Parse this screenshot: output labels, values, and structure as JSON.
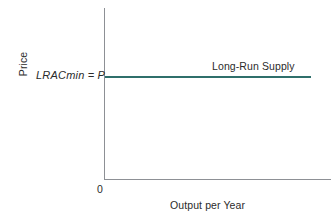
{
  "chart_data": {
    "type": "line",
    "title": "",
    "subtitle": "",
    "xlabel": "Output per Year",
    "ylabel": "Price",
    "origin_label": "0",
    "y_value_label": "LRACmin = P",
    "annotations": [
      {
        "text": "Long-Run Supply",
        "position": "above-right-of-line"
      }
    ],
    "series": [
      {
        "name": "Long-Run Supply",
        "color": "#2f6f6b",
        "shape": "horizontal",
        "y_value": "LRACmin = P",
        "x": [
          0,
          100
        ],
        "values": [
          60,
          60
        ]
      }
    ],
    "xlim": [
      0,
      110
    ],
    "ylim": [
      0,
      100
    ],
    "grid": false,
    "legend": "inline-annotation",
    "axis_color": "#8d9095",
    "background": "#ffffff"
  },
  "axes": {
    "y_label": "Price",
    "x_label": "Output per Year",
    "origin": "0",
    "price_level_label": "LRACmin = P"
  },
  "curve": {
    "label": "Long-Run Supply",
    "color": "#2f6f6b"
  }
}
